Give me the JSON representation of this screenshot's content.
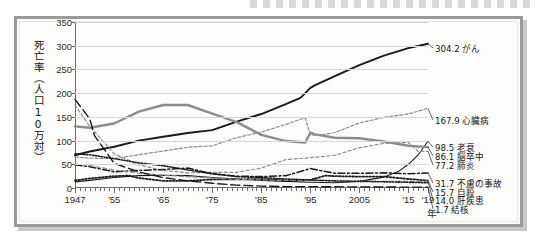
{
  "chart_data": {
    "type": "line",
    "title": "",
    "xlabel": "年",
    "ylabel": "死亡率（人口10万対）",
    "ylim": [
      0,
      350
    ],
    "yticks": [
      0,
      50,
      100,
      150,
      200,
      250,
      300,
      350
    ],
    "xlim": [
      1947,
      2019
    ],
    "xticklabels": [
      "1947",
      "'55",
      "'65",
      "'75",
      "'85",
      "'95",
      "2005",
      "'15",
      "'19"
    ],
    "xtickvalues": [
      1947,
      1955,
      1965,
      1975,
      1985,
      1995,
      2005,
      2015,
      2019
    ],
    "grid": true,
    "legend_position": "right-inline",
    "series": [
      {
        "name": "がん",
        "end_value": "304.2",
        "label": "304.2 がん",
        "color": "#1a1a1a",
        "style": "solid",
        "width": 1.9,
        "x": [
          1947,
          1950,
          1955,
          1960,
          1965,
          1970,
          1975,
          1980,
          1985,
          1990,
          1993,
          1995,
          1996,
          2000,
          2005,
          2010,
          2015,
          2019
        ],
        "y": [
          69,
          77,
          87,
          100,
          108,
          116,
          122,
          140,
          156,
          177,
          190,
          211,
          217,
          236,
          259,
          279,
          295,
          304.2
        ]
      },
      {
        "name": "心臓病",
        "end_value": "167.9",
        "label": "167.9 心臓病",
        "color": "#8c8c8a",
        "style": "dashed-fine",
        "width": 1.2,
        "x": [
          1947,
          1950,
          1955,
          1960,
          1965,
          1970,
          1975,
          1980,
          1985,
          1990,
          1993,
          1994,
          1995,
          1997,
          2000,
          2005,
          2010,
          2015,
          2019
        ],
        "y": [
          65,
          63,
          62,
          70,
          78,
          86,
          89,
          106,
          118,
          134,
          145,
          147,
          112,
          111,
          117,
          137,
          149,
          156,
          167.9
        ]
      },
      {
        "name": "老衰",
        "end_value": "98.5",
        "label": "98.5 老衰",
        "color": "#1a1a1a",
        "style": "solid-thin",
        "width": 1.1,
        "x": [
          1947,
          1950,
          1955,
          1960,
          1965,
          1970,
          1975,
          1980,
          1985,
          1990,
          1995,
          2000,
          2005,
          2010,
          2013,
          2015,
          2017,
          2019
        ],
        "y": [
          13,
          16,
          22,
          26,
          27,
          26,
          22,
          19,
          16,
          14,
          12,
          11,
          14,
          23,
          35,
          50,
          70,
          98.5
        ]
      },
      {
        "name": "脳卒中",
        "end_value": "86.1",
        "label": "86.1 脳卒中",
        "color": "#8c8c8a",
        "style": "solid-thick-gray",
        "width": 2.4,
        "x": [
          1947,
          1950,
          1955,
          1960,
          1965,
          1970,
          1975,
          1980,
          1985,
          1990,
          1994,
          1995,
          1996,
          2000,
          2005,
          2010,
          2015,
          2019
        ],
        "y": [
          130,
          127,
          136,
          161,
          175,
          175,
          157,
          139,
          112,
          99,
          96,
          117,
          113,
          106,
          105,
          98,
          89,
          86.1
        ]
      },
      {
        "name": "肺炎",
        "end_value": "77.2",
        "label": "77.2 肺炎",
        "color": "#8c8c8a",
        "style": "dashed-fine2",
        "width": 1.2,
        "x": [
          1947,
          1950,
          1955,
          1960,
          1965,
          1970,
          1975,
          1980,
          1985,
          1990,
          1995,
          2000,
          2005,
          2010,
          2015,
          2017,
          2019
        ],
        "y": [
          175,
          130,
          72,
          49,
          37,
          32,
          33,
          33,
          42,
          60,
          64,
          69,
          85,
          94,
          96,
          77,
          77.2
        ]
      },
      {
        "name": "不慮の事故",
        "end_value": "31.7",
        "label": "31.7 不慮の事故",
        "color": "#1a1a1a",
        "style": "dash-dot",
        "width": 1.5,
        "x": [
          1947,
          1950,
          1955,
          1960,
          1965,
          1970,
          1975,
          1980,
          1985,
          1990,
          1995,
          2000,
          2005,
          2010,
          2015,
          2019
        ],
        "y": [
          49,
          45,
          34,
          37,
          39,
          42,
          30,
          25,
          24,
          26,
          41,
          31,
          31,
          32,
          30,
          31.7
        ]
      },
      {
        "name": "自殺",
        "end_value": "15.7",
        "label": "15.7 自殺",
        "color": "#1a1a1a",
        "style": "dotted-heavy",
        "width": 1.8,
        "x": [
          1947,
          1950,
          1955,
          1958,
          1960,
          1965,
          1970,
          1975,
          1980,
          1985,
          1990,
          1995,
          1998,
          2000,
          2005,
          2010,
          2015,
          2019
        ],
        "y": [
          16,
          20,
          25,
          26,
          21,
          15,
          15,
          18,
          18,
          19,
          16,
          17,
          26,
          25,
          24,
          24,
          19,
          15.7
        ]
      },
      {
        "name": "肝疾患",
        "end_value": "14.0",
        "label": "14.0 肝疾患",
        "color": "#8c8c8a",
        "style": "dashed-gray",
        "width": 1.3,
        "x": [
          1947,
          1950,
          1955,
          1960,
          1965,
          1970,
          1975,
          1980,
          1985,
          1990,
          1995,
          2000,
          2005,
          2010,
          2015,
          2019
        ],
        "y": [
          50,
          47,
          38,
          31,
          27,
          24,
          21,
          18,
          17,
          16,
          16,
          15,
          14,
          14,
          14,
          14.0
        ]
      },
      {
        "name": "結核",
        "end_value": "1.7",
        "label": "1.7 結核",
        "color": "#1a1a1a",
        "style": "dashed-long",
        "width": 1.4,
        "x": [
          1947,
          1950,
          1951,
          1955,
          1960,
          1965,
          1970,
          1975,
          1980,
          1985,
          1990,
          1995,
          2000,
          2005,
          2010,
          2015,
          2019
        ],
        "y": [
          187,
          146,
          110,
          52,
          34,
          22,
          15,
          10,
          6,
          4,
          3,
          3,
          2.5,
          2.3,
          2,
          1.9,
          1.7
        ]
      },
      {
        "name": "胃腸炎系",
        "end_value": "",
        "label": "",
        "color": "#1a1a1a",
        "style": "dotted-fine",
        "width": 1.6,
        "x": [
          1947,
          1950,
          1955,
          1960,
          1965,
          1970,
          1975,
          1980,
          1985,
          1990,
          1995,
          2000,
          2005,
          2010,
          2015,
          2019
        ],
        "y": [
          72,
          70,
          62,
          53,
          47,
          38,
          30,
          24,
          22,
          19,
          17,
          15,
          14,
          13,
          12,
          11
        ]
      }
    ],
    "right_labels": [
      {
        "text": "304.2 がん",
        "y_value": 304.2
      },
      {
        "text": "167.9 心臓病",
        "y_value": 167.9
      },
      {
        "text": "98.5 老衰",
        "y_value": 98.5
      },
      {
        "text": "86.1 脳卒中",
        "y_value": 86.1
      },
      {
        "text": "77.2 肺炎",
        "y_value": 77.2
      },
      {
        "text": "31.7 不慮の事故",
        "y_value": 31.7
      },
      {
        "text": "15.7 自殺",
        "y_value": 15.7
      },
      {
        "text": "14.0 肝疾患",
        "y_value": 14.0
      },
      {
        "text": "1.7 結核",
        "y_value": 1.7
      }
    ]
  }
}
